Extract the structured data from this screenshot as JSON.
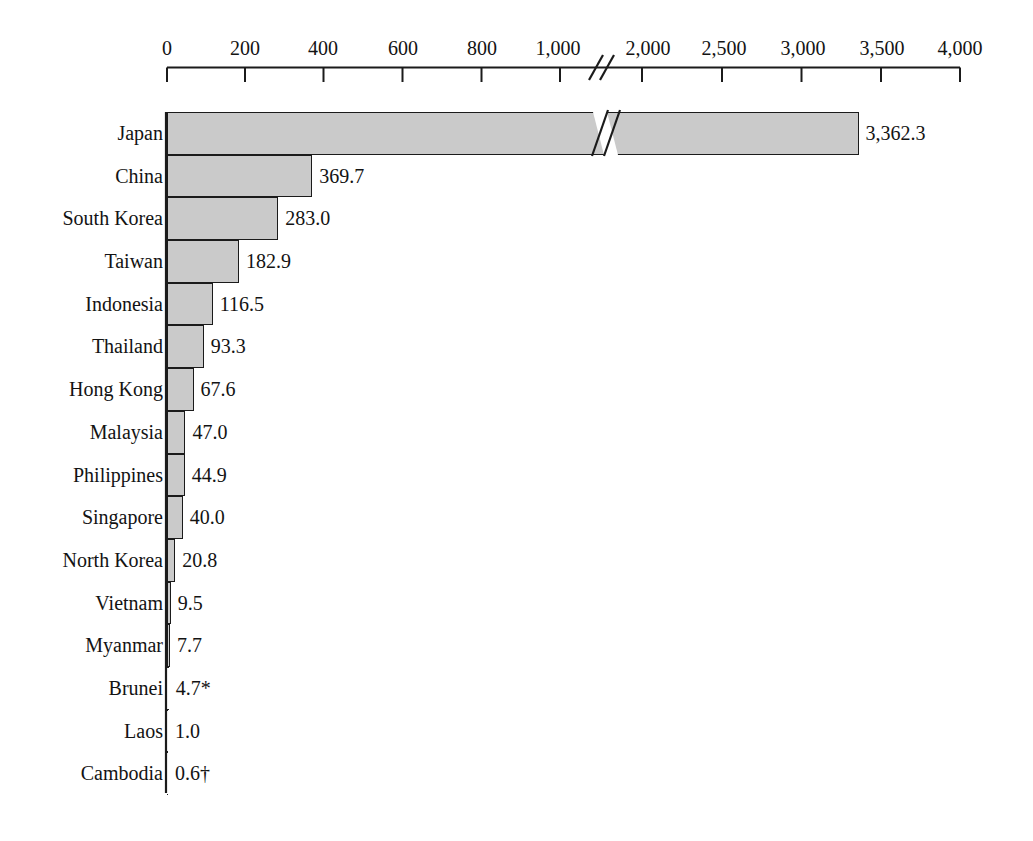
{
  "chart_data": {
    "type": "bar",
    "orientation": "horizontal",
    "title": "",
    "subtitle": "",
    "xlabel": "",
    "ylabel": "",
    "grid": false,
    "legend": null,
    "axis_break": {
      "present": true,
      "after_value": 1000,
      "resume_value": 2000
    },
    "xlim": [
      0,
      4000
    ],
    "xticks": [
      0,
      200,
      400,
      600,
      800,
      1000,
      2000,
      2500,
      3000,
      3500,
      4000
    ],
    "xtick_labels": [
      "0",
      "200",
      "400",
      "600",
      "800",
      "1,000",
      "2,000",
      "2,500",
      "3,000",
      "3,500",
      "4,000"
    ],
    "categories": [
      "Japan",
      "China",
      "South Korea",
      "Taiwan",
      "Indonesia",
      "Thailand",
      "Hong Kong",
      "Malaysia",
      "Philippines",
      "Singapore",
      "North Korea",
      "Vietnam",
      "Myanmar",
      "Brunei",
      "Laos",
      "Cambodia"
    ],
    "values": [
      3362.3,
      369.7,
      283.0,
      182.9,
      116.5,
      93.3,
      67.6,
      47.0,
      44.9,
      40.0,
      20.8,
      9.5,
      7.7,
      4.7,
      1.0,
      0.6
    ],
    "value_labels": [
      "3,362.3",
      "369.7",
      "283.0",
      "182.9",
      "116.5",
      "93.3",
      "67.6",
      "47.0",
      "44.9",
      "40.0",
      "20.8",
      "9.5",
      "7.7",
      "4.7*",
      "1.0",
      "0.6†"
    ],
    "footnote_markers": {
      "Brunei": "*",
      "Cambodia": "†"
    },
    "colors": {
      "bar_fill": "#cacaca",
      "bar_stroke": "#1b1b1b",
      "axis": "#1b1b1b",
      "text": "#131313",
      "background": "#ffffff"
    }
  }
}
